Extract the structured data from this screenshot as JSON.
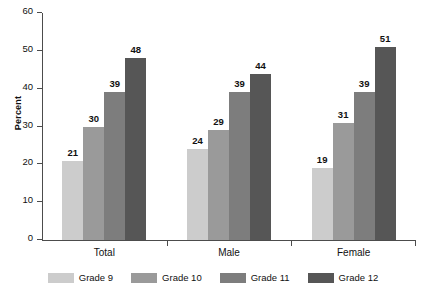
{
  "chart_data": {
    "type": "bar",
    "title": "",
    "xlabel": "",
    "ylabel": "Percent",
    "ylim": [
      0,
      60
    ],
    "yticks": [
      0,
      10,
      20,
      30,
      40,
      50,
      60
    ],
    "grid": false,
    "legend_position": "bottom",
    "categories": [
      "Total",
      "Male",
      "Female"
    ],
    "series": [
      {
        "name": "Grade 9",
        "color": "#cccccc",
        "values": [
          21,
          24,
          19
        ]
      },
      {
        "name": "Grade 10",
        "color": "#9a9a9a",
        "values": [
          30,
          29,
          31
        ]
      },
      {
        "name": "Grade 11",
        "color": "#7d7d7d",
        "values": [
          39,
          39,
          39
        ]
      },
      {
        "name": "Grade 12",
        "color": "#565656",
        "values": [
          48,
          44,
          51
        ]
      }
    ]
  },
  "axis": {
    "y_label": "Percent",
    "y_tick_labels": [
      "0",
      "10",
      "20",
      "30",
      "40",
      "50",
      "60"
    ]
  },
  "groups": [
    {
      "label": "Total",
      "bars": [
        {
          "series": "Grade 9",
          "value": 21,
          "value_label": "21"
        },
        {
          "series": "Grade 10",
          "value": 30,
          "value_label": "30"
        },
        {
          "series": "Grade 11",
          "value": 39,
          "value_label": "39"
        },
        {
          "series": "Grade 12",
          "value": 48,
          "value_label": "48"
        }
      ]
    },
    {
      "label": "Male",
      "bars": [
        {
          "series": "Grade 9",
          "value": 24,
          "value_label": "24"
        },
        {
          "series": "Grade 10",
          "value": 29,
          "value_label": "29"
        },
        {
          "series": "Grade 11",
          "value": 39,
          "value_label": "39"
        },
        {
          "series": "Grade 12",
          "value": 44,
          "value_label": "44"
        }
      ]
    },
    {
      "label": "Female",
      "bars": [
        {
          "series": "Grade 9",
          "value": 19,
          "value_label": "19"
        },
        {
          "series": "Grade 10",
          "value": 31,
          "value_label": "31"
        },
        {
          "series": "Grade 11",
          "value": 39,
          "value_label": "39"
        },
        {
          "series": "Grade 12",
          "value": 51,
          "value_label": "51"
        }
      ]
    }
  ],
  "legend": {
    "items": [
      {
        "label": "Grade 9",
        "color": "#cccccc"
      },
      {
        "label": "Grade 10",
        "color": "#9a9a9a"
      },
      {
        "label": "Grade 11",
        "color": "#7d7d7d"
      },
      {
        "label": "Grade 12",
        "color": "#565656"
      }
    ]
  },
  "colors": {
    "axis": "#4c4c4c",
    "text": "#111111",
    "background": "#ffffff"
  }
}
